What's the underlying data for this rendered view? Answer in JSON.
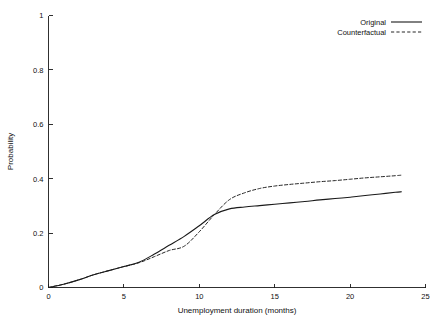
{
  "chart_data": {
    "type": "line",
    "title": "",
    "subtitle": "",
    "xlabel": "Unemployment duration (months)",
    "ylabel": "Probability",
    "xlim": [
      0,
      25
    ],
    "ylim": [
      0,
      1
    ],
    "xticks": [
      0,
      5,
      10,
      15,
      20,
      25
    ],
    "xticklabels": [
      "0",
      "5",
      "10",
      "15",
      "20",
      "25"
    ],
    "yticks": [
      0,
      0.2,
      0.4,
      0.6,
      0.8,
      1
    ],
    "yticklabels": [
      "0",
      "0.2",
      "0.4",
      "0.6",
      "0.8",
      "1"
    ],
    "grid": false,
    "legend_position": "top-right",
    "x": [
      0,
      1,
      2,
      3,
      4,
      5,
      6,
      7,
      8,
      9,
      10,
      11,
      12,
      13,
      14,
      15,
      16,
      17,
      18,
      19,
      20,
      21,
      22,
      23,
      23.4
    ],
    "series": [
      {
        "name": "Original",
        "style": "solid",
        "color": "#1a1a1a",
        "values": [
          0.0,
          0.012,
          0.028,
          0.047,
          0.062,
          0.077,
          0.093,
          0.122,
          0.155,
          0.188,
          0.227,
          0.268,
          0.289,
          0.296,
          0.301,
          0.306,
          0.311,
          0.316,
          0.322,
          0.327,
          0.332,
          0.338,
          0.344,
          0.35,
          0.352
        ]
      },
      {
        "name": "Counterfactual",
        "style": "dashed",
        "color": "#1a1a1a",
        "values": [
          0.0,
          0.012,
          0.028,
          0.047,
          0.062,
          0.077,
          0.091,
          0.113,
          0.136,
          0.152,
          0.205,
          0.268,
          0.323,
          0.348,
          0.364,
          0.373,
          0.379,
          0.384,
          0.389,
          0.393,
          0.398,
          0.403,
          0.407,
          0.411,
          0.413
        ]
      }
    ]
  },
  "legend": {
    "entries": [
      {
        "label": "Original"
      },
      {
        "label": "Counterfactual"
      }
    ]
  },
  "axes": {
    "x_title": "Unemployment duration (months)",
    "y_title": "Probability"
  }
}
